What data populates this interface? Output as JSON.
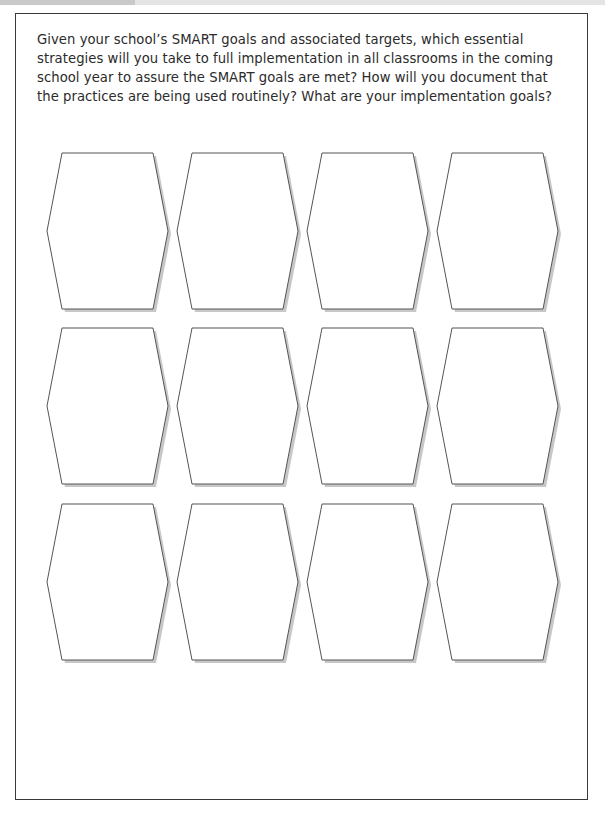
{
  "worksheet": {
    "prompt": "Given your school’s SMART goals and associated targets, which essential strategies will you take to full implementation in all classrooms in the coming school year to assure the SMART goals are met? How will you document that the practices are being used routinely? What are your implementation goals?"
  },
  "hexagons": {
    "rows": 3,
    "columns": 4,
    "cells": [
      {
        "row": 1,
        "col": 1,
        "text": ""
      },
      {
        "row": 1,
        "col": 2,
        "text": ""
      },
      {
        "row": 1,
        "col": 3,
        "text": ""
      },
      {
        "row": 1,
        "col": 4,
        "text": ""
      },
      {
        "row": 2,
        "col": 1,
        "text": ""
      },
      {
        "row": 2,
        "col": 2,
        "text": ""
      },
      {
        "row": 2,
        "col": 3,
        "text": ""
      },
      {
        "row": 2,
        "col": 4,
        "text": ""
      },
      {
        "row": 3,
        "col": 1,
        "text": ""
      },
      {
        "row": 3,
        "col": 2,
        "text": ""
      },
      {
        "row": 3,
        "col": 3,
        "text": ""
      },
      {
        "row": 3,
        "col": 4,
        "text": ""
      }
    ]
  },
  "colors": {
    "border": "#3a3a3a",
    "hex_stroke": "#555555",
    "hex_shadow": "#bdbdbd",
    "text": "#2b2b2b"
  }
}
